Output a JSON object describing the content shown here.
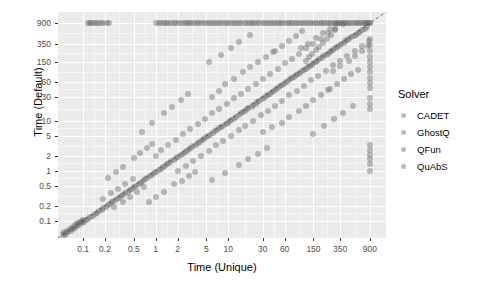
{
  "chart_data": {
    "type": "scatter",
    "title": "",
    "xlabel": "Time (Unique)",
    "ylabel": "Time (Default)",
    "xscale": "log",
    "yscale": "log",
    "xticks": [
      "0.1",
      "0.2",
      "0.5",
      "1",
      "2",
      "5",
      "10",
      "30",
      "60",
      "150",
      "350",
      "900"
    ],
    "xtick_values": [
      0.1,
      0.2,
      0.5,
      1,
      2,
      5,
      10,
      30,
      60,
      150,
      350,
      900
    ],
    "yticks": [
      "900",
      "350",
      "150",
      "60",
      "30",
      "10",
      "5",
      "2",
      "1",
      "0.5",
      "0.2",
      "0.1"
    ],
    "ytick_values": [
      900,
      350,
      150,
      60,
      30,
      10,
      5,
      2,
      1,
      0.5,
      0.2,
      0.1
    ],
    "xlim": [
      0.045,
      1500
    ],
    "ylim": [
      0.045,
      1500
    ],
    "grid": true,
    "panel_background": "#ebebeb",
    "gridline_color": "#ffffff",
    "point_color": "#666666",
    "point_opacity": 0.42,
    "reference_line": {
      "type": "dashed",
      "slope": 1,
      "intercept": 0,
      "label": "y = x",
      "color": "#555555"
    },
    "legend": {
      "title": "Solver",
      "position": "right",
      "entries": [
        {
          "label": "CADET",
          "color": "#666666"
        },
        {
          "label": "GhostQ",
          "color": "#666666"
        },
        {
          "label": "QFun",
          "color": "#666666"
        },
        {
          "label": "QuAbS",
          "color": "#666666"
        }
      ]
    },
    "points": [
      [
        900,
        900
      ],
      [
        900,
        900
      ],
      [
        860,
        900
      ],
      [
        820,
        900
      ],
      [
        780,
        900
      ],
      [
        760,
        900
      ],
      [
        700,
        900
      ],
      [
        660,
        900
      ],
      [
        620,
        900
      ],
      [
        580,
        900
      ],
      [
        540,
        900
      ],
      [
        500,
        900
      ],
      [
        470,
        900
      ],
      [
        440,
        900
      ],
      [
        410,
        900
      ],
      [
        380,
        900
      ],
      [
        355,
        900
      ],
      [
        330,
        900
      ],
      [
        305,
        900
      ],
      [
        285,
        900
      ],
      [
        265,
        900
      ],
      [
        245,
        900
      ],
      [
        228,
        900
      ],
      [
        212,
        900
      ],
      [
        196,
        900
      ],
      [
        182,
        900
      ],
      [
        168,
        900
      ],
      [
        156,
        900
      ],
      [
        144,
        900
      ],
      [
        133,
        900
      ],
      [
        123,
        900
      ],
      [
        114,
        900
      ],
      [
        105,
        900
      ],
      [
        97,
        900
      ],
      [
        90,
        900
      ],
      [
        83,
        900
      ],
      [
        77,
        900
      ],
      [
        71,
        900
      ],
      [
        66,
        900
      ],
      [
        61,
        900
      ],
      [
        56,
        900
      ],
      [
        52,
        900
      ],
      [
        48,
        900
      ],
      [
        44,
        900
      ],
      [
        41,
        900
      ],
      [
        38,
        900
      ],
      [
        35,
        900
      ],
      [
        32,
        900
      ],
      [
        30,
        900
      ],
      [
        27,
        900
      ],
      [
        25,
        900
      ],
      [
        23,
        900
      ],
      [
        21,
        900
      ],
      [
        20,
        900
      ],
      [
        18,
        900
      ],
      [
        17,
        900
      ],
      [
        15,
        900
      ],
      [
        14,
        900
      ],
      [
        13,
        900
      ],
      [
        12,
        900
      ],
      [
        11,
        900
      ],
      [
        10,
        900
      ],
      [
        9.2,
        900
      ],
      [
        8.5,
        900
      ],
      [
        7.8,
        900
      ],
      [
        7.2,
        900
      ],
      [
        6.6,
        900
      ],
      [
        6.1,
        900
      ],
      [
        5.6,
        900
      ],
      [
        5.2,
        900
      ],
      [
        4.8,
        900
      ],
      [
        4.4,
        900
      ],
      [
        4.0,
        900
      ],
      [
        3.7,
        900
      ],
      [
        3.4,
        900
      ],
      [
        3.1,
        900
      ],
      [
        2.9,
        900
      ],
      [
        2.7,
        900
      ],
      [
        2.5,
        900
      ],
      [
        2.3,
        900
      ],
      [
        2.1,
        900
      ],
      [
        1.9,
        900
      ],
      [
        1.8,
        900
      ],
      [
        1.65,
        900
      ],
      [
        1.5,
        900
      ],
      [
        1.4,
        900
      ],
      [
        1.3,
        900
      ],
      [
        1.2,
        900
      ],
      [
        1.1,
        900
      ],
      [
        1.0,
        900
      ],
      [
        0.115,
        900
      ],
      [
        0.125,
        900
      ],
      [
        0.13,
        900
      ],
      [
        0.14,
        900
      ],
      [
        0.15,
        900
      ],
      [
        0.16,
        900
      ],
      [
        0.175,
        900
      ],
      [
        0.19,
        900
      ],
      [
        0.21,
        900
      ],
      [
        0.23,
        900
      ],
      [
        900,
        430
      ],
      [
        900,
        330
      ],
      [
        900,
        250
      ],
      [
        900,
        190
      ],
      [
        900,
        150
      ],
      [
        900,
        120
      ],
      [
        900,
        95
      ],
      [
        900,
        72
      ],
      [
        900,
        58
      ],
      [
        900,
        46
      ],
      [
        900,
        28
      ],
      [
        900,
        22
      ],
      [
        900,
        17
      ],
      [
        900,
        3.2
      ],
      [
        900,
        2.6
      ],
      [
        900,
        2.1
      ],
      [
        900,
        1.7
      ],
      [
        900,
        1.35
      ],
      [
        900,
        1.0
      ],
      [
        820,
        760
      ],
      [
        760,
        700
      ],
      [
        700,
        640
      ],
      [
        650,
        600
      ],
      [
        610,
        560
      ],
      [
        570,
        520
      ],
      [
        540,
        500
      ],
      [
        500,
        470
      ],
      [
        470,
        440
      ],
      [
        440,
        410
      ],
      [
        410,
        390
      ],
      [
        390,
        360
      ],
      [
        360,
        340
      ],
      [
        340,
        320
      ],
      [
        320,
        300
      ],
      [
        300,
        280
      ],
      [
        280,
        265
      ],
      [
        265,
        250
      ],
      [
        250,
        235
      ],
      [
        235,
        220
      ],
      [
        220,
        205
      ],
      [
        205,
        195
      ],
      [
        195,
        182
      ],
      [
        180,
        172
      ],
      [
        170,
        160
      ],
      [
        160,
        150
      ],
      [
        150,
        142
      ],
      [
        142,
        133
      ],
      [
        133,
        125
      ],
      [
        125,
        118
      ],
      [
        118,
        110
      ],
      [
        110,
        104
      ],
      [
        104,
        98
      ],
      [
        98,
        92
      ],
      [
        92,
        86
      ],
      [
        86,
        81
      ],
      [
        81,
        76
      ],
      [
        76,
        71
      ],
      [
        71,
        67
      ],
      [
        67,
        63
      ],
      [
        63,
        59
      ],
      [
        59,
        55
      ],
      [
        55,
        52
      ],
      [
        52,
        49
      ],
      [
        49,
        46
      ],
      [
        46,
        43
      ],
      [
        43,
        40
      ],
      [
        40,
        38
      ],
      [
        38,
        35
      ],
      [
        35,
        33
      ],
      [
        33,
        31
      ],
      [
        31,
        29
      ],
      [
        29,
        27
      ],
      [
        27,
        25
      ],
      [
        25,
        24
      ],
      [
        24,
        22
      ],
      [
        22,
        21
      ],
      [
        21,
        19
      ],
      [
        19,
        18
      ],
      [
        18,
        17
      ],
      [
        17,
        16
      ],
      [
        16,
        15
      ],
      [
        15,
        14
      ],
      [
        14,
        13
      ],
      [
        13,
        12
      ],
      [
        12,
        11
      ],
      [
        11,
        10.5
      ],
      [
        10.5,
        9.8
      ],
      [
        9.8,
        9.2
      ],
      [
        9.2,
        8.6
      ],
      [
        8.6,
        8.0
      ],
      [
        8.0,
        7.5
      ],
      [
        7.5,
        7.0
      ],
      [
        7.0,
        6.6
      ],
      [
        6.6,
        6.1
      ],
      [
        6.1,
        5.7
      ],
      [
        5.7,
        5.3
      ],
      [
        5.3,
        5.0
      ],
      [
        5.0,
        4.7
      ],
      [
        4.7,
        4.4
      ],
      [
        4.4,
        4.1
      ],
      [
        4.1,
        3.8
      ],
      [
        3.8,
        3.6
      ],
      [
        3.6,
        3.3
      ],
      [
        3.3,
        3.1
      ],
      [
        3.1,
        2.9
      ],
      [
        2.9,
        2.7
      ],
      [
        2.7,
        2.5
      ],
      [
        2.5,
        2.35
      ],
      [
        2.35,
        2.2
      ],
      [
        2.2,
        2.05
      ],
      [
        2.05,
        1.9
      ],
      [
        1.9,
        1.8
      ],
      [
        1.8,
        1.65
      ],
      [
        1.65,
        1.55
      ],
      [
        1.55,
        1.45
      ],
      [
        1.45,
        1.35
      ],
      [
        1.35,
        1.25
      ],
      [
        1.25,
        1.17
      ],
      [
        1.17,
        1.1
      ],
      [
        1.1,
        1.02
      ],
      [
        1.02,
        0.95
      ],
      [
        0.95,
        0.89
      ],
      [
        0.89,
        0.83
      ],
      [
        0.83,
        0.77
      ],
      [
        0.77,
        0.72
      ],
      [
        0.72,
        0.67
      ],
      [
        0.67,
        0.62
      ],
      [
        0.62,
        0.58
      ],
      [
        0.58,
        0.54
      ],
      [
        0.54,
        0.5
      ],
      [
        0.5,
        0.47
      ],
      [
        0.47,
        0.44
      ],
      [
        0.44,
        0.41
      ],
      [
        0.41,
        0.38
      ],
      [
        0.38,
        0.355
      ],
      [
        0.355,
        0.33
      ],
      [
        0.33,
        0.31
      ],
      [
        0.31,
        0.29
      ],
      [
        0.29,
        0.27
      ],
      [
        0.27,
        0.25
      ],
      [
        0.25,
        0.235
      ],
      [
        0.235,
        0.22
      ],
      [
        0.22,
        0.205
      ],
      [
        0.205,
        0.19
      ],
      [
        0.19,
        0.18
      ],
      [
        0.18,
        0.165
      ],
      [
        0.165,
        0.155
      ],
      [
        0.155,
        0.145
      ],
      [
        0.145,
        0.135
      ],
      [
        0.135,
        0.125
      ],
      [
        0.125,
        0.118
      ],
      [
        0.118,
        0.11
      ],
      [
        0.11,
        0.102
      ],
      [
        0.102,
        0.095
      ],
      [
        0.095,
        0.089
      ],
      [
        0.089,
        0.083
      ],
      [
        0.083,
        0.077
      ],
      [
        0.077,
        0.072
      ],
      [
        0.072,
        0.067
      ],
      [
        0.067,
        0.062
      ],
      [
        0.062,
        0.058
      ],
      [
        0.058,
        0.054
      ],
      [
        0.054,
        0.05
      ],
      [
        340,
        900
      ],
      [
        300,
        640
      ],
      [
        260,
        520
      ],
      [
        230,
        430
      ],
      [
        200,
        360
      ],
      [
        180,
        300
      ],
      [
        160,
        260
      ],
      [
        145,
        215
      ],
      [
        130,
        185
      ],
      [
        118,
        160
      ],
      [
        1.0,
        2.0
      ],
      [
        1.2,
        2.6
      ],
      [
        1.5,
        3.2
      ],
      [
        1.9,
        4.2
      ],
      [
        2.4,
        5.4
      ],
      [
        3.0,
        6.8
      ],
      [
        3.8,
        8.5
      ],
      [
        4.8,
        11
      ],
      [
        6.0,
        14
      ],
      [
        7.5,
        17
      ],
      [
        9.5,
        22
      ],
      [
        12,
        28
      ],
      [
        15,
        35
      ],
      [
        19,
        44
      ],
      [
        24,
        55
      ],
      [
        30,
        70
      ],
      [
        38,
        88
      ],
      [
        48,
        110
      ],
      [
        60,
        140
      ],
      [
        75,
        175
      ],
      [
        95,
        220
      ],
      [
        120,
        280
      ],
      [
        150,
        350
      ],
      [
        190,
        440
      ],
      [
        240,
        560
      ],
      [
        300,
        700
      ],
      [
        380,
        880
      ],
      [
        2.0,
        1.0
      ],
      [
        2.6,
        1.25
      ],
      [
        3.3,
        1.6
      ],
      [
        4.2,
        2.0
      ],
      [
        5.4,
        2.5
      ],
      [
        6.8,
        3.2
      ],
      [
        8.6,
        4.0
      ],
      [
        11,
        5.0
      ],
      [
        14,
        6.4
      ],
      [
        17,
        8.0
      ],
      [
        22,
        10
      ],
      [
        28,
        13
      ],
      [
        35,
        16
      ],
      [
        44,
        20
      ],
      [
        55,
        25
      ],
      [
        70,
        32
      ],
      [
        88,
        40
      ],
      [
        110,
        50
      ],
      [
        140,
        64
      ],
      [
        175,
        80
      ],
      [
        220,
        100
      ],
      [
        280,
        128
      ],
      [
        350,
        160
      ],
      [
        440,
        200
      ],
      [
        560,
        250
      ],
      [
        700,
        320
      ],
      [
        880,
        400
      ],
      [
        0.5,
        1.8
      ],
      [
        0.35,
        1.2
      ],
      [
        0.28,
        0.95
      ],
      [
        0.22,
        0.7
      ],
      [
        0.6,
        2.3
      ],
      [
        0.75,
        2.9
      ],
      [
        0.9,
        3.5
      ],
      [
        1.8,
        0.55
      ],
      [
        1.3,
        0.38
      ],
      [
        1.0,
        0.3
      ],
      [
        0.8,
        0.24
      ],
      [
        2.3,
        0.62
      ],
      [
        2.9,
        0.8
      ],
      [
        3.5,
        0.95
      ],
      [
        30,
        6.0
      ],
      [
        40,
        7.5
      ],
      [
        55,
        9.0
      ],
      [
        70,
        12
      ],
      [
        95,
        16
      ],
      [
        120,
        20
      ],
      [
        150,
        26
      ],
      [
        190,
        33
      ],
      [
        240,
        42
      ],
      [
        6.0,
        30
      ],
      [
        7.5,
        40
      ],
      [
        9.0,
        55
      ],
      [
        12,
        70
      ],
      [
        16,
        95
      ],
      [
        20,
        120
      ],
      [
        26,
        150
      ],
      [
        33,
        190
      ],
      [
        42,
        240
      ],
      [
        0.07,
        0.07
      ],
      [
        0.075,
        0.078
      ],
      [
        0.08,
        0.085
      ],
      [
        0.085,
        0.09
      ],
      [
        0.09,
        0.095
      ],
      [
        0.095,
        0.1
      ],
      [
        0.1,
        0.105
      ],
      [
        0.06,
        0.062
      ],
      [
        0.065,
        0.068
      ],
      [
        0.055,
        0.058
      ],
      [
        0.052,
        0.055
      ],
      [
        160,
        460
      ],
      [
        200,
        560
      ],
      [
        250,
        700
      ],
      [
        310,
        860
      ],
      [
        125,
        350
      ],
      [
        100,
        280
      ],
      [
        460,
        160
      ],
      [
        560,
        200
      ],
      [
        700,
        250
      ],
      [
        860,
        310
      ],
      [
        350,
        125
      ],
      [
        280,
        100
      ],
      [
        8,
        210
      ],
      [
        11,
        290
      ],
      [
        14,
        380
      ],
      [
        5.5,
        150
      ],
      [
        20,
        520
      ],
      [
        210,
        8
      ],
      [
        290,
        11
      ],
      [
        380,
        14
      ],
      [
        150,
        5.5
      ],
      [
        520,
        20
      ],
      [
        1.3,
        14
      ],
      [
        1.7,
        19
      ],
      [
        2.2,
        26
      ],
      [
        2.8,
        34
      ],
      [
        0.9,
        9
      ],
      [
        0.65,
        6
      ],
      [
        14,
        1.3
      ],
      [
        19,
        1.7
      ],
      [
        26,
        2.2
      ],
      [
        34,
        2.8
      ],
      [
        9,
        0.9
      ],
      [
        6,
        0.65
      ],
      [
        0.24,
        0.35
      ],
      [
        0.3,
        0.44
      ],
      [
        0.38,
        0.55
      ],
      [
        0.48,
        0.68
      ],
      [
        0.19,
        0.27
      ],
      [
        0.35,
        0.24
      ],
      [
        0.44,
        0.3
      ],
      [
        0.55,
        0.38
      ],
      [
        0.68,
        0.48
      ],
      [
        0.27,
        0.19
      ],
      [
        55,
        320
      ],
      [
        68,
        400
      ],
      [
        85,
        500
      ],
      [
        105,
        620
      ],
      [
        44,
        250
      ],
      [
        320,
        55
      ],
      [
        400,
        68
      ],
      [
        500,
        85
      ],
      [
        620,
        105
      ],
      [
        250,
        44
      ]
    ]
  }
}
